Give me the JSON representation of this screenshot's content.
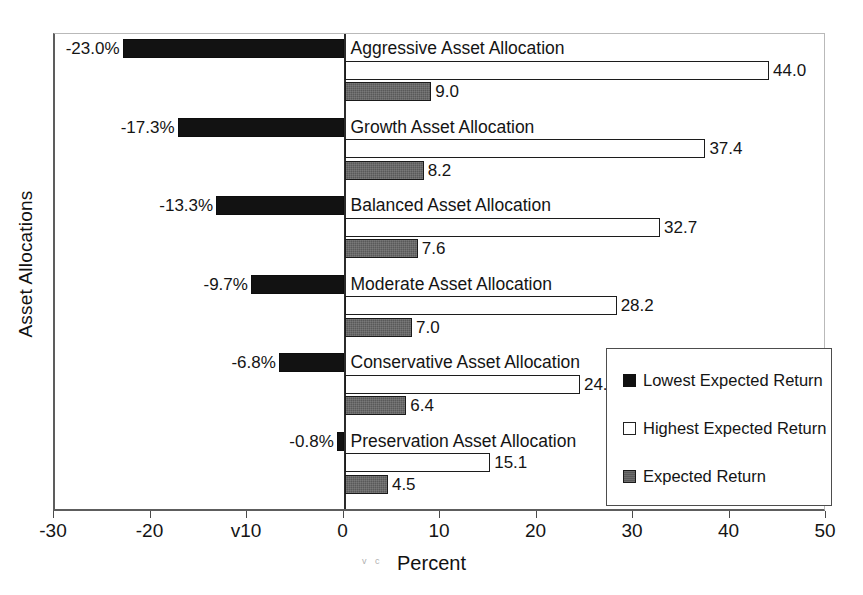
{
  "chart_data": {
    "type": "bar",
    "orientation": "horizontal",
    "title": "",
    "xlabel": "Percent",
    "ylabel": "Asset Allocations",
    "xlim": [
      -30,
      50
    ],
    "xticks": [
      -30,
      -20,
      -10,
      0,
      10,
      20,
      30,
      40,
      50
    ],
    "xtick_labels": [
      "-30",
      "-20",
      "v10",
      "0",
      "10",
      "20",
      "30",
      "40",
      "50"
    ],
    "grid": false,
    "legend_position": "center-right",
    "categories": [
      "Aggressive Asset Allocation",
      "Growth Asset Allocation",
      "Balanced Asset Allocation",
      "Moderate Asset Allocation",
      "Conservative Asset Allocation",
      "Preservation Asset Allocation"
    ],
    "series": [
      {
        "name": "Lowest Expected Return",
        "color": "#121212",
        "values": [
          -23.0,
          -17.3,
          -13.3,
          -9.7,
          -6.8,
          -0.8
        ],
        "labels": [
          "-23.0%",
          "-17.3%",
          "-13.3%",
          "-9.7%",
          "-6.8%",
          "-0.8%"
        ]
      },
      {
        "name": "Highest Expected Return",
        "color": "#ffffff",
        "values": [
          44.0,
          37.4,
          32.7,
          28.2,
          24.4,
          15.1
        ],
        "labels": [
          "44.0",
          "37.4",
          "32.7",
          "28.2",
          "24.4",
          "15.1"
        ]
      },
      {
        "name": "Expected Return",
        "color": "#595959",
        "values": [
          9.0,
          8.2,
          7.6,
          7.0,
          6.4,
          4.5
        ],
        "labels": [
          "9.0",
          "8.2",
          "7.6",
          "7.0",
          "6.4",
          "4.5"
        ]
      }
    ]
  },
  "legend": {
    "items": [
      {
        "label": "Lowest Expected Return"
      },
      {
        "label": "Highest Expected Return"
      },
      {
        "label": "Expected Return"
      }
    ]
  },
  "axis": {
    "x_title": "Percent",
    "y_title": "Asset Allocations"
  },
  "artifacts": {
    "scan_smudge": "v c"
  }
}
